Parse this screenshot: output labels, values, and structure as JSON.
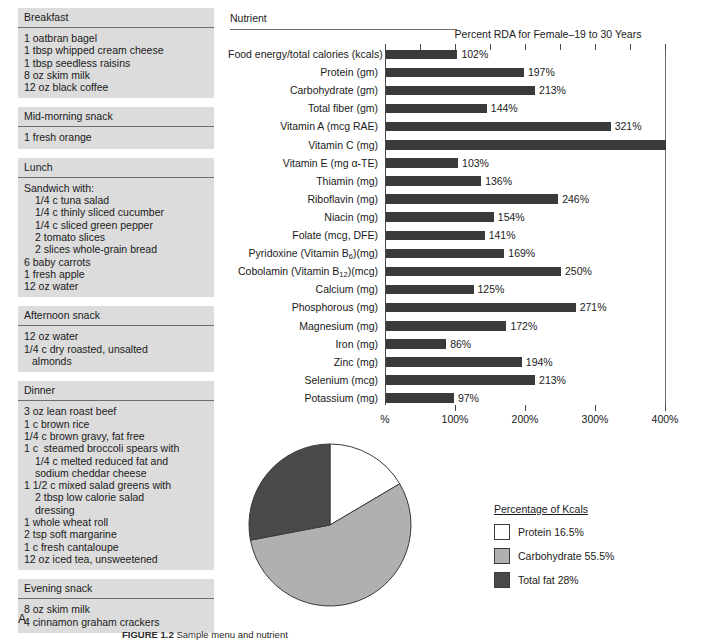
{
  "menu": {
    "sections": [
      {
        "header": "Breakfast",
        "items": [
          {
            "text": "1 oatbran bagel",
            "indent": 0
          },
          {
            "text": "1 tbsp whipped cream cheese",
            "indent": 0
          },
          {
            "text": "1 tbsp seedless raisins",
            "indent": 0
          },
          {
            "text": "8 oz skim milk",
            "indent": 0
          },
          {
            "text": "12 oz black coffee",
            "indent": 0
          }
        ]
      },
      {
        "header": "Mid-morning snack",
        "items": [
          {
            "text": "1 fresh orange",
            "indent": 0
          }
        ]
      },
      {
        "header": "Lunch",
        "items": [
          {
            "text": "Sandwich with:",
            "indent": 0
          },
          {
            "text": "1/4 c tuna salad",
            "indent": 1
          },
          {
            "text": "1/4 c thinly sliced cucumber",
            "indent": 1
          },
          {
            "text": "1/4 c sliced green pepper",
            "indent": 1
          },
          {
            "text": "2 tomato slices",
            "indent": 1
          },
          {
            "text": "2 slices whole-grain bread",
            "indent": 1
          },
          {
            "text": "6 baby carrots",
            "indent": 0
          },
          {
            "text": "1 fresh apple",
            "indent": 0
          },
          {
            "text": "12 oz water",
            "indent": 0
          }
        ]
      },
      {
        "header": "Afternoon snack",
        "items": [
          {
            "text": "12 oz water",
            "indent": 0
          },
          {
            "text": "1/4 c dry roasted, unsalted",
            "indent": 0
          },
          {
            "text": "almonds",
            "indent": 2
          }
        ]
      },
      {
        "header": "Dinner",
        "items": [
          {
            "text": "3 oz lean roast beef",
            "indent": 0
          },
          {
            "text": "1 c brown rice",
            "indent": 0
          },
          {
            "text": "1/4 c brown gravy, fat free",
            "indent": 0
          },
          {
            "text": "1 c  steamed broccoli spears with",
            "indent": 0
          },
          {
            "text": "1/4 c melted reduced fat and",
            "indent": 1
          },
          {
            "text": "sodium cheddar cheese",
            "indent": 1
          },
          {
            "text": "1 1/2 c mixed salad greens with",
            "indent": 0
          },
          {
            "text": "2 tbsp low calorie salad",
            "indent": 1
          },
          {
            "text": "dressing",
            "indent": 1
          },
          {
            "text": "1 whole wheat roll",
            "indent": 0
          },
          {
            "text": "2 tsp soft margarine",
            "indent": 0
          },
          {
            "text": "1 c fresh cantaloupe",
            "indent": 0
          },
          {
            "text": "12 oz iced tea, unsweetened",
            "indent": 0
          }
        ]
      },
      {
        "header": "Evening snack",
        "items": [
          {
            "text": "8 oz skim milk",
            "indent": 0
          },
          {
            "text": "4 cinnamon graham crackers",
            "indent": 0
          }
        ]
      }
    ]
  },
  "panel_letter": "A",
  "chart": {
    "column_header": "Nutrient",
    "title": "Percent RDA for Female–19 to 30 Years"
  },
  "chart_data": {
    "type": "bar",
    "orientation": "horizontal",
    "title": "Percent RDA for Female–19 to 30 Years",
    "xlabel": "",
    "ylabel": "Nutrient",
    "xlim": [
      0,
      400
    ],
    "grid": false,
    "bar_color": "#3a3a3a",
    "xticks": [
      0,
      100,
      200,
      300,
      400
    ],
    "xticklabels": [
      "%",
      "100%",
      "200%",
      "300%",
      "400%"
    ],
    "minor_xticks": [
      50,
      100,
      150,
      200,
      250,
      300,
      350,
      400
    ],
    "categories": [
      "Food energy/total calories (kcals)",
      "Protein (gm)",
      "Carbohydrate (gm)",
      "Total fiber (gm)",
      "Vitamin A (mcg RAE)",
      "Vitamin C (mg)",
      "Vitamin E (mg α-TE)",
      "Thiamin (mg)",
      "Riboflavin (mg)",
      "Niacin (mg)",
      "Folate (mcg, DFE)",
      "Pyridoxine (Vitamin B6)(mg)",
      "Cobolamin (Vitamin B12)(mcg)",
      "Calcium (mg)",
      "Phosphorous (mg)",
      "Magnesium (mg)",
      "Iron (mg)",
      "Zinc (mg)",
      "Selenium (mcg)",
      "Potassium (mg)"
    ],
    "values": [
      102,
      197,
      213,
      144,
      321,
      400,
      103,
      136,
      246,
      154,
      141,
      169,
      250,
      125,
      271,
      172,
      86,
      194,
      213,
      97
    ],
    "value_labels": [
      "102%",
      "197%",
      "213%",
      "144%",
      "321%",
      "",
      "103%",
      "136%",
      "246%",
      "154%",
      "141%",
      "169%",
      "250%",
      "125%",
      "271%",
      "172%",
      "86%",
      "194%",
      "213%",
      "97%"
    ],
    "bars": [
      {
        "label": "Food energy/total calories (kcals)",
        "value": 102,
        "value_label": "102%"
      },
      {
        "label": "Protein (gm)",
        "value": 197,
        "value_label": "197%"
      },
      {
        "label": "Carbohydrate (gm)",
        "value": 213,
        "value_label": "213%"
      },
      {
        "label": "Total fiber (gm)",
        "value": 144,
        "value_label": "144%"
      },
      {
        "label": "Vitamin A (mcg RAE)",
        "value": 321,
        "value_label": "321%"
      },
      {
        "label": "Vitamin C (mg)",
        "value": 400,
        "value_label": "",
        "note": "bar extends to full axis, no value label shown"
      },
      {
        "label": "Vitamin E (mg α-TE)",
        "value": 103,
        "value_label": "103%"
      },
      {
        "label": "Thiamin (mg)",
        "value": 136,
        "value_label": "136%"
      },
      {
        "label": "Riboflavin (mg)",
        "value": 246,
        "value_label": "246%"
      },
      {
        "label": "Niacin (mg)",
        "value": 154,
        "value_label": "154%"
      },
      {
        "label": "Folate (mcg, DFE)",
        "value": 141,
        "value_label": "141%"
      },
      {
        "label": "Pyridoxine (Vitamin B6)(mg)",
        "value": 169,
        "value_label": "169%"
      },
      {
        "label": "Cobolamin (Vitamin B12)(mcg)",
        "value": 250,
        "value_label": "250%"
      },
      {
        "label": "Calcium (mg)",
        "value": 125,
        "value_label": "125%"
      },
      {
        "label": "Phosphorous (mg)",
        "value": 271,
        "value_label": "271%"
      },
      {
        "label": "Magnesium (mg)",
        "value": 172,
        "value_label": "172%"
      },
      {
        "label": "Iron (mg)",
        "value": 86,
        "value_label": "86%"
      },
      {
        "label": "Zinc (mg)",
        "value": 194,
        "value_label": "194%"
      },
      {
        "label": "Selenium (mcg)",
        "value": 213,
        "value_label": "213%"
      },
      {
        "label": "Potassium (mg)",
        "value": 97,
        "value_label": "97%"
      }
    ]
  },
  "pie_chart": {
    "type": "pie",
    "legend_title": "Percentage of Kcals",
    "legend_position": "right",
    "start_angle_deg": 0,
    "direction": "clockwise",
    "labels": [
      "Protein",
      "Carbohydrate",
      "Total fat"
    ],
    "values": [
      16.5,
      55.5,
      28
    ],
    "colors": [
      "#ffffff",
      "#b0b0b0",
      "#4a4a4a"
    ],
    "slices": [
      {
        "label": "Protein",
        "value": 16.5,
        "legend_text": "Protein 16.5%",
        "color": "#ffffff"
      },
      {
        "label": "Carbohydrate",
        "value": 55.5,
        "legend_text": "Carbohydrate 55.5%",
        "color": "#b0b0b0"
      },
      {
        "label": "Total fat",
        "value": 28,
        "legend_text": "Total fat 28%",
        "color": "#4a4a4a"
      }
    ]
  },
  "caption": {
    "figure_number": "FIGURE 1.2",
    "text": "Sample menu and nutrient"
  }
}
